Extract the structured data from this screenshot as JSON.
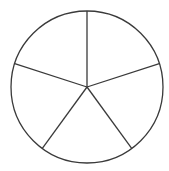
{
  "diagram": {
    "type": "divided-circle",
    "sectors": 5,
    "center": [
      87,
      87
    ],
    "radius": 76,
    "start_angle_deg": -90,
    "stroke_color": "#3a3a3a",
    "fill_color": "#ffffff"
  }
}
